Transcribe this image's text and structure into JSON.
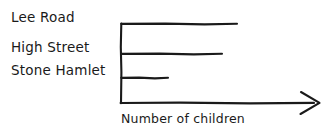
{
  "chart_data": {
    "type": "bar",
    "orientation": "horizontal",
    "title": "",
    "subtitle": "",
    "categories": [
      "Lee Road",
      "High Street",
      "Stone Hamlet"
    ],
    "values": [
      116,
      101,
      47
    ],
    "series": [
      {
        "name": "Number of children",
        "values": [
          116,
          101,
          47
        ]
      }
    ],
    "xlabel": "Number of children",
    "ylabel": "",
    "xlim": [
      0,
      199
    ],
    "ylim": null,
    "xticks": [],
    "yticks": [
      "Lee Road",
      "High Street",
      "Stone Hamlet"
    ],
    "xtick_labels": [],
    "grid": false,
    "legend": false,
    "legend_position": "none",
    "annotations": [],
    "style": "hand-drawn",
    "bar_color": "#1a1a1a",
    "axis_color": "#1a1a1a",
    "background_color": "#ffffff",
    "x_axis_has_arrow": true
  },
  "geometry": {
    "width": 331,
    "height": 135,
    "axis_origin_x": 121,
    "axis_baseline_y": 103,
    "axis_top_y": 24,
    "axis_end_x": 320,
    "bars": [
      {
        "category": "Lee Road",
        "y": 24,
        "x_end": 237
      },
      {
        "category": "High Street",
        "y": 54,
        "x_end": 222
      },
      {
        "category": "Stone Hamlet",
        "y": 78,
        "x_end": 168
      }
    ]
  },
  "labels": {
    "category_1": "Lee Road",
    "category_2": "High Street",
    "category_3": "Stone Hamlet",
    "x_axis": "Number of children"
  }
}
